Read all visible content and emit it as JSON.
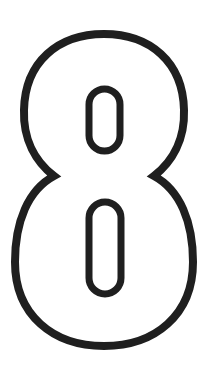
{
  "figure": {
    "glyph": "8",
    "colors": {
      "stroke": "#1f1f1f",
      "background": "#ffffff"
    }
  }
}
